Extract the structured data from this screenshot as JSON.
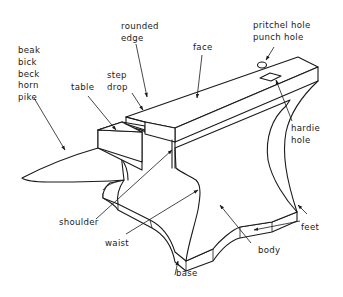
{
  "diagram": {
    "labels": {
      "beak": [
        "beak",
        "bick",
        "beck",
        "horn",
        "pike"
      ],
      "rounded_edge": [
        "rounded",
        "edge"
      ],
      "table": "table",
      "step": [
        "step",
        "drop"
      ],
      "face": "face",
      "pritchel": [
        "pritchel hole",
        "punch hole"
      ],
      "hardie": [
        "hardie",
        "hole"
      ],
      "shoulder": "shoulder",
      "waist": "waist",
      "body": "body",
      "feet": "feet",
      "base": "base"
    },
    "colors": {
      "line": "#1a1a1a",
      "background": "#ffffff"
    }
  }
}
